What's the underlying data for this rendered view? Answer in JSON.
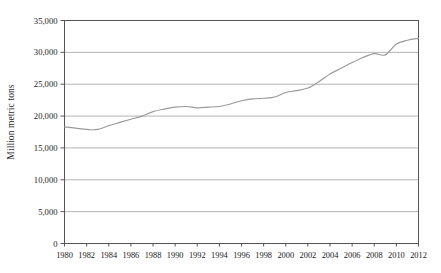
{
  "chart_data": {
    "type": "line",
    "title": "",
    "xlabel": "",
    "ylabel": "Million metric tons",
    "xlim": [
      1980,
      2012
    ],
    "ylim": [
      0,
      35000
    ],
    "grid": true,
    "legend": "none",
    "series_color": "#9a9a9a",
    "grid_color": "#b4b4b4",
    "axis_color": "#555555",
    "ytick_labels": [
      "35,000",
      "30,000",
      "25,000",
      "20,000",
      "15,000",
      "10,000",
      "5,000",
      "0"
    ],
    "ytick_values": [
      35000,
      30000,
      25000,
      20000,
      15000,
      10000,
      5000,
      0
    ],
    "xtick_labels": [
      "1980",
      "1982",
      "1984",
      "1986",
      "1988",
      "1990",
      "1992",
      "1994",
      "1996",
      "1998",
      "2000",
      "2002",
      "2004",
      "2006",
      "2008",
      "2010",
      "2012"
    ],
    "xtick_values": [
      1980,
      1982,
      1984,
      1986,
      1988,
      1990,
      1992,
      1994,
      1996,
      1998,
      2000,
      2002,
      2004,
      2006,
      2008,
      2010,
      2012
    ],
    "x": [
      1980,
      1981,
      1982,
      1983,
      1984,
      1985,
      1986,
      1987,
      1988,
      1989,
      1990,
      1991,
      1992,
      1993,
      1994,
      1995,
      1996,
      1997,
      1998,
      1999,
      2000,
      2001,
      2002,
      2003,
      2004,
      2005,
      2006,
      2007,
      2008,
      2009,
      2010,
      2011,
      2012
    ],
    "values": [
      18300,
      18100,
      17900,
      17900,
      18500,
      19000,
      19500,
      20000,
      20700,
      21100,
      21400,
      21500,
      21300,
      21400,
      21500,
      21900,
      22400,
      22700,
      22800,
      23000,
      23700,
      24000,
      24400,
      25400,
      26600,
      27500,
      28400,
      29200,
      29800,
      29600,
      31300,
      31900,
      32200
    ]
  }
}
